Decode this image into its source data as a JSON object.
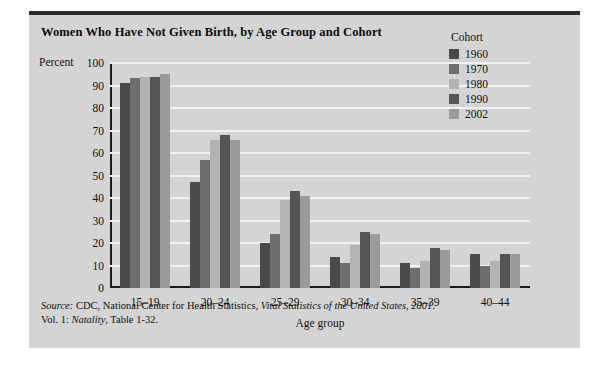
{
  "figure": {
    "title": "Women Who Have Not Given Birth, by Age Group and Cohort",
    "percent_axis_label": "Percent",
    "source_line1_prefix": "Source:",
    "source_line1_rest": " CDC, National Center for Health Statistics, ",
    "source_line1_italic": "Vital Statistics of the United States, 2001",
    "source_line1_end": ".",
    "source_line2_prefix": "Vol. 1: ",
    "source_line2_italic": "Natality",
    "source_line2_end": ", Table 1-32.",
    "background": "#d4d4d4",
    "rule_color": "#2b2b2b"
  },
  "legend": {
    "title": "Cohort",
    "entries": [
      {
        "label": "1960",
        "color": "#4a4a4a"
      },
      {
        "label": "1970",
        "color": "#6e6e6e"
      },
      {
        "label": "1980",
        "color": "#b3b3b3"
      },
      {
        "label": "1990",
        "color": "#555555"
      },
      {
        "label": "2002",
        "color": "#9a9a9a"
      }
    ]
  },
  "chart_data": {
    "type": "bar",
    "title": "Women Who Have Not Given Birth, by Age Group and Cohort",
    "xlabel": "Age group",
    "ylabel": "Percent",
    "ylim": [
      0,
      100
    ],
    "yticks": [
      0,
      10,
      20,
      30,
      40,
      50,
      60,
      70,
      80,
      90,
      100
    ],
    "grid": true,
    "legend_position": "top-right",
    "categories": [
      "15–19",
      "20–24",
      "25–29",
      "30–34",
      "35–39",
      "40–44"
    ],
    "series": [
      {
        "name": "1960",
        "color": "#4a4a4a",
        "values": [
          91,
          47,
          20,
          14,
          11,
          15
        ]
      },
      {
        "name": "1970",
        "color": "#6e6e6e",
        "values": [
          93.5,
          57,
          24,
          11,
          9,
          10
        ]
      },
      {
        "name": "1980",
        "color": "#b3b3b3",
        "values": [
          94,
          66,
          39,
          19,
          12,
          12
        ]
      },
      {
        "name": "1990",
        "color": "#555555",
        "values": [
          94,
          68,
          43,
          25,
          18,
          15
        ]
      },
      {
        "name": "2002",
        "color": "#9a9a9a",
        "values": [
          95,
          66,
          41,
          24,
          17,
          15
        ]
      }
    ]
  }
}
